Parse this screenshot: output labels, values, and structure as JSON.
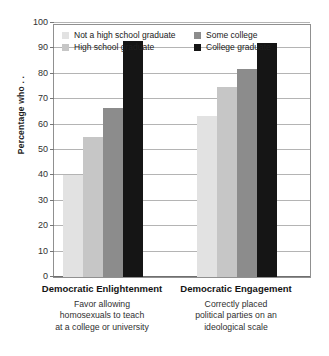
{
  "chart_data": {
    "type": "bar",
    "title": "",
    "xlabel": "",
    "ylabel": "Percentage who . .",
    "ylim": [
      0,
      100
    ],
    "ytick_step": 10,
    "yticks": [
      100,
      90,
      80,
      70,
      60,
      50,
      40,
      30,
      20,
      10,
      0
    ],
    "grid": true,
    "legend_position": "top-inside",
    "categories": [
      "Democratic Enlightenment",
      "Democratic Engagement"
    ],
    "category_subtitles": [
      [
        "Favor allowing",
        "homosexuals to teach",
        "at a college or university"
      ],
      [
        "Correctly placed",
        "political parties on an",
        "ideological scale"
      ]
    ],
    "series": [
      {
        "name": "Not a high school graduate",
        "color": "#e2e2e2",
        "values": [
          40,
          63.5
        ]
      },
      {
        "name": "High school graduate",
        "color": "#c6c6c6",
        "values": [
          55,
          75
        ]
      },
      {
        "name": "Some college",
        "color": "#8c8c8c",
        "values": [
          66.5,
          82
        ]
      },
      {
        "name": "College graduate",
        "color": "#151515",
        "values": [
          93,
          92
        ]
      }
    ]
  },
  "legend": {
    "items": [
      {
        "label": "Not a high school graduate",
        "color": "#e2e2e2"
      },
      {
        "label": "Some college",
        "color": "#8c8c8c"
      },
      {
        "label": "High school graduate",
        "color": "#c6c6c6"
      },
      {
        "label": "College graduate",
        "color": "#151515"
      }
    ]
  }
}
